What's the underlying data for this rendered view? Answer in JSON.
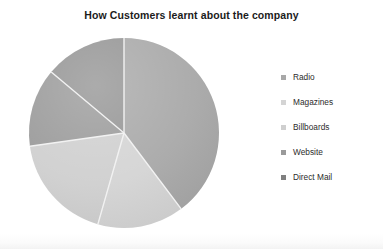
{
  "chart_data": {
    "type": "pie",
    "title": "How Customers learnt about the company",
    "xlabel": "",
    "ylabel": "",
    "legend_position": "right",
    "grid": false,
    "categories": [
      "Radio",
      "Magazines",
      "Billboards",
      "Website",
      "Direct Mail"
    ],
    "values": [
      39.7,
      14.7,
      18.3,
      13.4,
      13.9
    ],
    "unit": "%",
    "start_angle_deg": 0,
    "direction": "clockwise",
    "slices": [
      {
        "label": "Radio",
        "value": 39.7,
        "color": "#a8a8a8",
        "start_deg": 0,
        "end_deg": 143
      },
      {
        "label": "Magazines",
        "value": 14.7,
        "color": "#d4d4d4",
        "start_deg": 143,
        "end_deg": 196
      },
      {
        "label": "Billboards",
        "value": 18.3,
        "color": "#cfcfcf",
        "start_deg": 196,
        "end_deg": 262
      },
      {
        "label": "Website",
        "value": 13.4,
        "color": "#9a9a9a",
        "start_deg": 262,
        "end_deg": 310
      },
      {
        "label": "Direct Mail",
        "value": 13.9,
        "color": "#949494",
        "start_deg": 310,
        "end_deg": 360
      }
    ]
  },
  "title": {
    "text": "How Customers learnt about the company"
  },
  "legend": {
    "items": [
      {
        "label": "Radio",
        "swatch": "#a8a8a8"
      },
      {
        "label": "Magazines",
        "swatch": "#d4d4d4"
      },
      {
        "label": "Billboards",
        "swatch": "#cfcfcf"
      },
      {
        "label": "Website",
        "swatch": "#9a9a9a"
      },
      {
        "label": "Direct Mail",
        "swatch": "#808080"
      }
    ]
  },
  "pie_geometry": {
    "center_x": 104,
    "center_y": 103,
    "radius": 95,
    "separator_color": "#f2f2f2",
    "separator_width": 1.4
  }
}
